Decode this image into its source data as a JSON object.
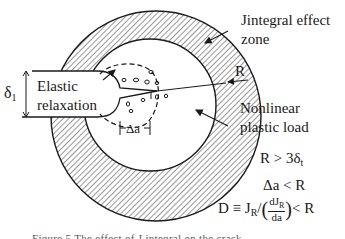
{
  "diagram": {
    "labels": {
      "j_zone_line1": "Jintegral effect",
      "j_zone_line2": "zone",
      "radius": "R",
      "nonlinear_line1": "Nonlinear",
      "nonlinear_line2": "plastic load",
      "delta1": "δ",
      "delta1_sub": "1",
      "elastic_line1": "Elastic",
      "elastic_line2": "relaxation",
      "delta_a": "Δa"
    },
    "conditions": {
      "c1_main": "R > 3δ",
      "c1_sub": "t",
      "c2": "Δa < R",
      "c3_prefix": "D ≡ J",
      "c3_sub": "R",
      "c3_slash": "/",
      "c3_num": "dJ",
      "c3_num_sub": "R",
      "c3_den": "da",
      "c3_suffix": "< R"
    },
    "caption": "Figure 5 The effect of J integral on the crack ... "
  }
}
